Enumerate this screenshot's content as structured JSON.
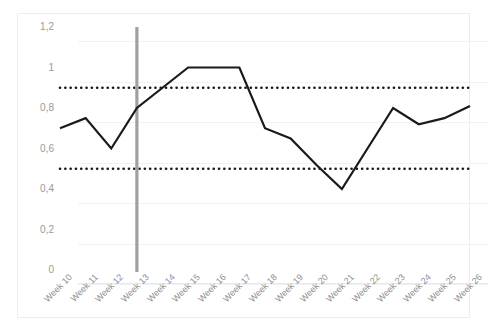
{
  "chart_data": {
    "type": "line",
    "title": "",
    "subtitle": "",
    "xlabel": "",
    "ylabel": "",
    "categories": [
      "Week 10",
      "Week 11",
      "Week 12",
      "Week 13",
      "Week 14",
      "Week 15",
      "Week 16",
      "Week 17",
      "Week 18",
      "Week 19",
      "Week 20",
      "Week 21",
      "Week 22",
      "Week 23",
      "Week 24",
      "Week 25",
      "Week 26"
    ],
    "series": [
      {
        "name": "value",
        "values": [
          0.7,
          0.75,
          0.6,
          0.8,
          0.9,
          1.0,
          1.0,
          1.0,
          0.7,
          0.65,
          0.52,
          0.4,
          0.6,
          0.8,
          0.72,
          0.75,
          0.81
        ],
        "color": "#1a1a1a",
        "style": "solid"
      }
    ],
    "reference_lines": [
      {
        "name": "upper-threshold",
        "value": 0.9,
        "style": "dotted",
        "color": "#1a1a1a",
        "orientation": "horizontal"
      },
      {
        "name": "lower-threshold",
        "value": 0.5,
        "style": "dotted",
        "color": "#1a1a1a",
        "orientation": "horizontal"
      }
    ],
    "marker_lines": [
      {
        "name": "week-13-marker",
        "category": "Week 13",
        "color": "#a0a0a0",
        "orientation": "vertical"
      }
    ],
    "ylim": [
      0,
      1.2
    ],
    "ytick_values": [
      0,
      0.2,
      0.4,
      0.6,
      0.8,
      1.0,
      1.2
    ],
    "ytick_labels": [
      "0",
      "0,2",
      "0,4",
      "0,6",
      "0,8",
      "1",
      "1,2"
    ],
    "grid": true,
    "grid_axis": "y",
    "legend": false,
    "legend_position": "none",
    "decimal_separator": ",",
    "xtick_rotation": -45
  },
  "colors": {
    "series": "#1a1a1a",
    "threshold": "#1a1a1a",
    "marker": "#a0a0a0",
    "grid": "#f2f2f2",
    "axis_text": "#9a9a9a",
    "frame": "#ededed",
    "background": "#ffffff"
  }
}
